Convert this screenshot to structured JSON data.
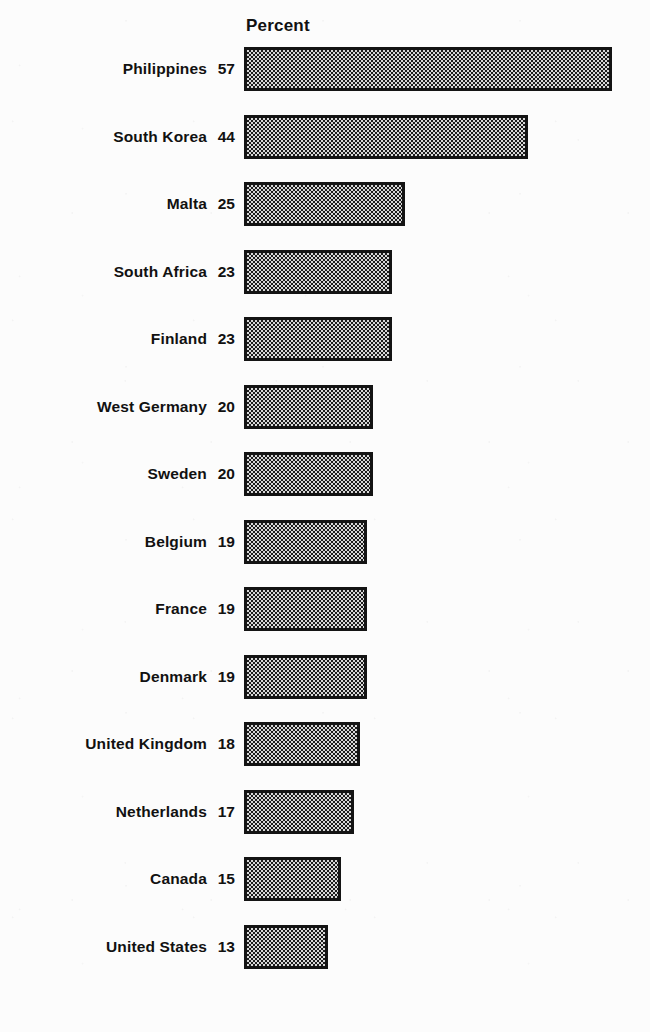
{
  "chart_data": {
    "type": "bar",
    "orientation": "horizontal",
    "title": "",
    "xlabel": "Percent",
    "ylabel": "",
    "axis_header": "Percent",
    "grid": false,
    "legend": null,
    "xlim": [
      0,
      57
    ],
    "categories": [
      "Philippines",
      "South Korea",
      "Malta",
      "South Africa",
      "Finland",
      "West Germany",
      "Sweden",
      "Belgium",
      "France",
      "Denmark",
      "United Kingdom",
      "Netherlands",
      "Canada",
      "United States"
    ],
    "values": [
      57,
      44,
      25,
      23,
      23,
      20,
      20,
      19,
      19,
      19,
      18,
      17,
      15,
      13
    ],
    "value_labels": [
      "57",
      "44",
      "25",
      "23",
      "23",
      "20",
      "20",
      "19",
      "19",
      "19",
      "18",
      "17",
      "15",
      "13"
    ],
    "units": "percent",
    "sorted": "descending"
  },
  "chart": {
    "title_cut_off": "",
    "percent_header": "Percent",
    "bar_fill_color": "#d8d8d8",
    "bar_pattern_color": "#1c1c1c",
    "bar_border_color": "#141414",
    "background_color": "#fcfcfc",
    "text_color": "#111111"
  },
  "rows": [
    {
      "label": "Philippines",
      "value": "57",
      "pct": 57
    },
    {
      "label": "South Korea",
      "value": "44",
      "pct": 44
    },
    {
      "label": "Malta",
      "value": "25",
      "pct": 25
    },
    {
      "label": "South Africa",
      "value": "23",
      "pct": 23
    },
    {
      "label": "Finland",
      "value": "23",
      "pct": 23
    },
    {
      "label": "West Germany",
      "value": "20",
      "pct": 20
    },
    {
      "label": "Sweden",
      "value": "20",
      "pct": 20
    },
    {
      "label": "Belgium",
      "value": "19",
      "pct": 19
    },
    {
      "label": "France",
      "value": "19",
      "pct": 19
    },
    {
      "label": "Denmark",
      "value": "19",
      "pct": 19
    },
    {
      "label": "United Kingdom",
      "value": "18",
      "pct": 18
    },
    {
      "label": "Netherlands",
      "value": "17",
      "pct": 17
    },
    {
      "label": "Canada",
      "value": "15",
      "pct": 15
    },
    {
      "label": "United States",
      "value": "13",
      "pct": 13
    }
  ],
  "layout": {
    "bar_origin_x": 244,
    "px_per_unit": 6.45,
    "first_row_top": 44,
    "row_pitch": 67.5
  }
}
